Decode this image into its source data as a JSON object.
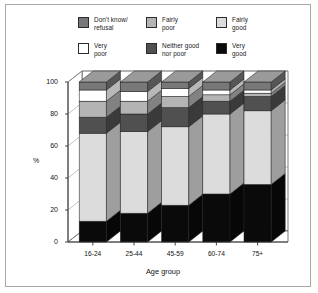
{
  "figure": {
    "background": "#ffffff",
    "frame_color": "#a8a8a8"
  },
  "legend": {
    "position": "top-center",
    "columns": 3,
    "rows": 2,
    "items": [
      {
        "label": "Don't know/\nrefusal",
        "color": "#787878",
        "key": "dont_know"
      },
      {
        "label": "Fairly\npoor",
        "color": "#b4b4b4",
        "key": "fairly_poor"
      },
      {
        "label": "Fairly\ngood",
        "color": "#dcdcdc",
        "key": "fairly_good"
      },
      {
        "label": "Very\npoor",
        "color": "#ffffff",
        "key": "very_poor"
      },
      {
        "label": "Neither good\nnor poor",
        "color": "#505050",
        "key": "neither"
      },
      {
        "label": "Very\ngood",
        "color": "#0a0a0a",
        "key": "very_good"
      }
    ]
  },
  "axes": {
    "ylabel": "%",
    "xlabel": "Age group",
    "yticks": [
      0,
      20,
      40,
      60,
      80,
      100
    ],
    "ylim": [
      0,
      100
    ],
    "grid": true
  },
  "chart_data": {
    "type": "bar",
    "subtype": "stacked-3d",
    "title": "",
    "xlabel": "Age group",
    "ylabel": "%",
    "ylim": [
      0,
      100
    ],
    "grid": true,
    "legend_position": "top-center",
    "categories": [
      "16-24",
      "25-44",
      "45-59",
      "60-74",
      "75+"
    ],
    "stack_order_bottom_to_top": [
      "Very good",
      "Fairly good",
      "Neither good nor poor",
      "Fairly poor",
      "Very poor",
      "Don't know/refusal"
    ],
    "series": [
      {
        "name": "Very good",
        "color": "#0a0a0a",
        "values": [
          13,
          18,
          23,
          30,
          36
        ]
      },
      {
        "name": "Fairly good",
        "color": "#dcdcdc",
        "values": [
          55,
          51,
          49,
          50,
          46
        ]
      },
      {
        "name": "Neither good nor poor",
        "color": "#505050",
        "values": [
          10,
          11,
          12,
          8,
          9
        ]
      },
      {
        "name": "Fairly poor",
        "color": "#b4b4b4",
        "values": [
          10,
          8,
          7,
          4,
          2
        ]
      },
      {
        "name": "Very poor",
        "color": "#ffffff",
        "values": [
          7,
          6,
          5,
          3,
          2
        ]
      },
      {
        "name": "Don't know/refusal",
        "color": "#787878",
        "values": [
          5,
          6,
          4,
          5,
          5
        ]
      }
    ],
    "cumulative_tops": [
      [
        13,
        68,
        78,
        88,
        95,
        100
      ],
      [
        18,
        69,
        80,
        88,
        94,
        100
      ],
      [
        23,
        72,
        84,
        91,
        96,
        100
      ],
      [
        30,
        80,
        88,
        92,
        95,
        100
      ],
      [
        36,
        82,
        91,
        93,
        95,
        100
      ]
    ]
  },
  "xticklabels": [
    "16-24",
    "25-44",
    "45-59",
    "60-74",
    "75+"
  ]
}
